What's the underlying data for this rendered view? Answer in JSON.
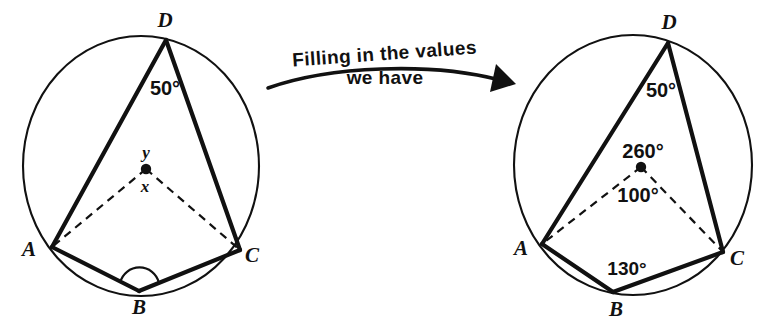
{
  "figure": {
    "background_color": "#ffffff",
    "ink_color": "#111111"
  },
  "caption": {
    "line1": "Filling in the values",
    "line2": "we  have",
    "arrow": "curved-right-arrow"
  },
  "left_diagram": {
    "name": "unknowns-diagram",
    "vertices": {
      "A": "A",
      "B": "B",
      "C": "C",
      "D": "D"
    },
    "center_dot": "circle-centre",
    "labels": {
      "angle_d": "50°",
      "reflex_centre": "y",
      "centre": "x"
    },
    "angle_arc_at_b": "angle-arc-B"
  },
  "right_diagram": {
    "name": "values-diagram",
    "vertices": {
      "A": "A",
      "B": "B",
      "C": "C",
      "D": "D"
    },
    "center_dot": "circle-centre",
    "labels": {
      "angle_d": "50°",
      "reflex_centre": "260°",
      "centre": "100°",
      "angle_b": "130°"
    }
  }
}
